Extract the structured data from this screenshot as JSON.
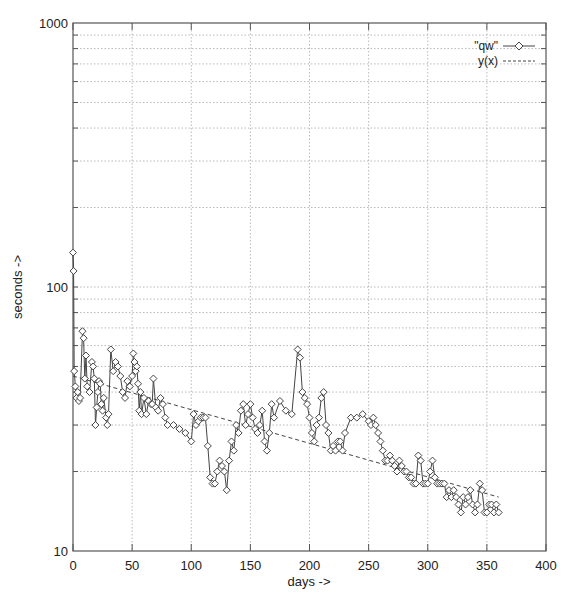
{
  "chart_data": {
    "type": "line",
    "title": "",
    "xlabel": "days ->",
    "ylabel": "seconds ->",
    "xlim": [
      0,
      400
    ],
    "ylim": [
      10,
      1000
    ],
    "yscale": "log",
    "grid": true,
    "legend_position": "top-right, inside",
    "x_ticks": [
      "0",
      "50",
      "100",
      "150",
      "200",
      "250",
      "300",
      "350",
      "400"
    ],
    "y_ticks": [
      "10",
      "100",
      "1000"
    ],
    "series": [
      {
        "name": "\"qw\"",
        "style": "solid line with open diamond markers",
        "x": [
          0,
          0.5,
          1,
          2,
          3,
          4,
          5,
          6,
          8,
          9,
          10,
          11,
          12,
          14,
          16,
          17,
          18,
          19,
          20,
          21,
          22,
          23,
          24,
          25,
          26,
          28,
          29,
          30,
          32,
          34,
          36,
          38,
          40,
          42,
          44,
          46,
          48,
          50,
          51,
          52,
          53,
          54,
          55,
          56,
          57,
          58,
          60,
          62,
          64,
          66,
          67,
          68,
          70,
          72,
          74,
          76,
          78,
          80,
          85,
          90,
          95,
          100,
          102,
          104,
          106,
          108,
          110,
          112,
          114,
          116,
          118,
          120,
          122,
          124,
          126,
          128,
          130,
          132,
          134,
          136,
          138,
          140,
          142,
          144,
          146,
          148,
          150,
          152,
          154,
          156,
          158,
          160,
          162,
          164,
          166,
          168,
          170,
          175,
          180,
          185,
          190,
          192,
          194,
          196,
          198,
          200,
          202,
          204,
          206,
          208,
          210,
          212,
          214,
          216,
          218,
          220,
          222,
          224,
          226,
          228,
          230,
          235,
          240,
          245,
          250,
          252,
          254,
          256,
          258,
          260,
          262,
          264,
          266,
          268,
          270,
          272,
          274,
          276,
          278,
          280,
          282,
          284,
          286,
          288,
          290,
          292,
          294,
          296,
          298,
          300,
          302,
          304,
          306,
          308,
          310,
          312,
          314,
          316,
          318,
          320,
          322,
          324,
          326,
          328,
          330,
          332,
          334,
          336,
          338,
          340,
          342,
          344,
          346,
          348,
          350,
          352,
          354,
          356,
          358,
          360
        ],
        "y": [
          135,
          115,
          48,
          42,
          38,
          40,
          37,
          38,
          68,
          64,
          45,
          55,
          42,
          40,
          52,
          50,
          45,
          30,
          35,
          40,
          44,
          43,
          36,
          34,
          38,
          32,
          30,
          33,
          58,
          48,
          52,
          50,
          46,
          40,
          38,
          44,
          42,
          46,
          56,
          52,
          48,
          50,
          43,
          34,
          40,
          33,
          38,
          33,
          37,
          36,
          36,
          45,
          35,
          34,
          38,
          36,
          32,
          30,
          30,
          29,
          28,
          26,
          33,
          30,
          31,
          32,
          32,
          32,
          25,
          19,
          18,
          18,
          20,
          22,
          21,
          20,
          17,
          22,
          26,
          24,
          30,
          28,
          34,
          36,
          30,
          33,
          36,
          32,
          29,
          28,
          30,
          34,
          26,
          24,
          28,
          36,
          32,
          37,
          34,
          33,
          58,
          54,
          40,
          38,
          36,
          32,
          28,
          26,
          30,
          32,
          38,
          40,
          30,
          28,
          24,
          25,
          24,
          26,
          26,
          24,
          28,
          32,
          32,
          33,
          31,
          30,
          32,
          30,
          28,
          26,
          24,
          22,
          22,
          23,
          22,
          21,
          20,
          22,
          21,
          20,
          20,
          19,
          19,
          18,
          18,
          23,
          22,
          18,
          18,
          18,
          20,
          22,
          19,
          18,
          18,
          18,
          18,
          16,
          17,
          16,
          17,
          16,
          15,
          14,
          16,
          15,
          16,
          17,
          15,
          14,
          15,
          18,
          17,
          14,
          14,
          15,
          15,
          14,
          15,
          14
        ]
      },
      {
        "name": "y(x)",
        "style": "dashed line (fit)",
        "x": [
          0,
          360
        ],
        "y": [
          46,
          16
        ]
      }
    ]
  },
  "axes": {
    "ylabel": "seconds ->",
    "xlabel": "days ->",
    "y_tick_labels": [
      "1000",
      "100",
      "10"
    ],
    "x_tick_labels": [
      "0",
      "50",
      "100",
      "150",
      "200",
      "250",
      "300",
      "350",
      "400"
    ]
  },
  "legend": {
    "entries": [
      {
        "label": "\"qw\"",
        "style": "line-diamond"
      },
      {
        "label": "y(x)",
        "style": "dashed"
      }
    ]
  },
  "colors": {
    "axis": "#555555",
    "grid": "#a8a8a8",
    "series": "#444444",
    "marker_fill": "#ffffff",
    "fit": "#444444"
  }
}
